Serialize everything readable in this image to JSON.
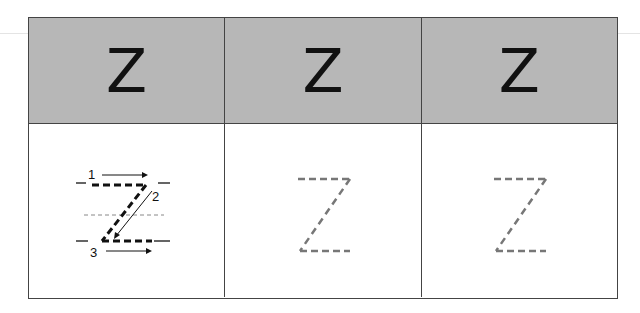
{
  "worksheet": {
    "header_cells": [
      {
        "letter": "Z"
      },
      {
        "letter": "Z"
      },
      {
        "letter": "Z"
      }
    ],
    "trace_cells": [
      {
        "type": "guided",
        "stroke_numbers": [
          "1",
          "2",
          "3"
        ],
        "stroke_color": "#111111"
      },
      {
        "type": "dashed",
        "stroke_color": "#777777"
      },
      {
        "type": "dashed",
        "stroke_color": "#777777"
      }
    ]
  }
}
